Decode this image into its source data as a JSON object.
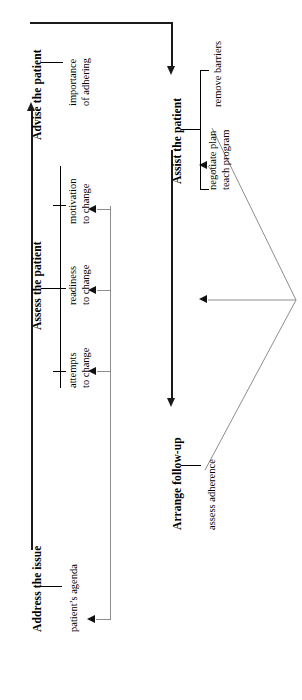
{
  "diagram": {
    "orientation": "rotated-90-ccw",
    "accent_color": "#111111",
    "feedback_color": "#6f6f6f",
    "stages": [
      {
        "id": "address",
        "label": "Address the issue",
        "items": [
          {
            "id": "patient-agenda",
            "line1": "patient’s agenda",
            "line2": ""
          }
        ]
      },
      {
        "id": "assess",
        "label": "Assess the patient",
        "items": [
          {
            "id": "attempts-to-change",
            "line1": "attempts",
            "line2": "to change"
          },
          {
            "id": "readiness-to-change",
            "line1": "readiness",
            "line2": "to change"
          },
          {
            "id": "motivation-to-change",
            "line1": "motivation",
            "line2": "to change"
          }
        ]
      },
      {
        "id": "advise",
        "label": "Advise the patient",
        "items": [
          {
            "id": "importance-of-adhering",
            "line1": "importance",
            "line2": "of adhering"
          }
        ]
      },
      {
        "id": "assist",
        "label": "Assist the patient",
        "items": [
          {
            "id": "negotiate-plan",
            "line1": "negotiate plan",
            "line2": "teach program"
          },
          {
            "id": "remove-barriers",
            "line1": "remove barriers",
            "line2": ""
          }
        ]
      },
      {
        "id": "arrange",
        "label": "Arrange follow-up",
        "items": [
          {
            "id": "assess-adherence",
            "line1": "assess adherence",
            "line2": ""
          }
        ]
      }
    ]
  }
}
